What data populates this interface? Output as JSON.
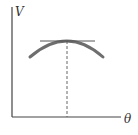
{
  "diagram": {
    "y_axis_label": "V",
    "x_axis_label": "θ",
    "caption": "",
    "colors": {
      "axes": "#444444",
      "curve": "#6e6e6e",
      "tangent": "#555555",
      "dashed": "#555555",
      "background": "#ffffff"
    },
    "elements": [
      {
        "type": "axis",
        "name": "y-axis"
      },
      {
        "type": "axis",
        "name": "x-axis"
      },
      {
        "type": "curve",
        "name": "concave-down-arc",
        "description": "curve with maximum"
      },
      {
        "type": "line",
        "name": "horizontal-tangent-at-maximum"
      },
      {
        "type": "dashed-line",
        "name": "vertical-drop-from-maximum-to-theta-axis"
      }
    ]
  }
}
